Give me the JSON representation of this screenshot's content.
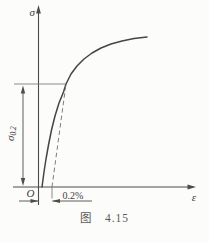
{
  "figure": {
    "kind": "stress-strain curve with 0.2% offset yield strength construction",
    "caption": {
      "label": "图",
      "number": "4.15"
    },
    "axis": {
      "y_label": "σ",
      "x_label": "ε",
      "origin_label": "O"
    },
    "labels": {
      "yield_stress_sigma": "σ",
      "yield_stress_subscript": "0.2",
      "offset_strain": "0.2%"
    },
    "colors": {
      "axis": "#4c4c4c",
      "curve": "#454545",
      "dashed": "#7e7e7e",
      "thin": "#6e6e6e",
      "text": "#3f3f3f",
      "caption": "#5a5a5a",
      "background": "#fcfcfa"
    },
    "chart_data": {
      "type": "line",
      "xlabel": "ε",
      "ylabel": "σ",
      "grid": false,
      "curve_points": [
        [
          42,
          187
        ],
        [
          44,
          172
        ],
        [
          46,
          159
        ],
        [
          48.5,
          145
        ],
        [
          51.5,
          130
        ],
        [
          55,
          116
        ],
        [
          59,
          103
        ],
        [
          63.5,
          92
        ],
        [
          66,
          84
        ],
        [
          71,
          74
        ],
        [
          77,
          66
        ],
        [
          84,
          59
        ],
        [
          92,
          53
        ],
        [
          101,
          48
        ],
        [
          111,
          44
        ],
        [
          122,
          41
        ],
        [
          134,
          38.5
        ],
        [
          147,
          37
        ]
      ],
      "offset_dashed_line": {
        "x1": 52,
        "y1": 187,
        "x2": 66,
        "y2": 84
      },
      "sigma02_reference_line": {
        "x1": 14,
        "y1": 84,
        "x2": 66,
        "y2": 84
      }
    }
  }
}
